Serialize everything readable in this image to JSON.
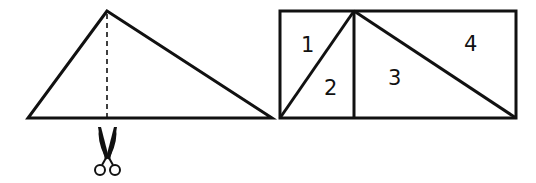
{
  "diagram": {
    "stroke_color": "#111111",
    "triangle": {
      "apex": [
        107,
        11
      ],
      "base_left": [
        28,
        118
      ],
      "base_right": [
        272,
        118
      ],
      "cut_line": "dashed altitude from apex to base",
      "cut_icon": "scissors-icon"
    },
    "rectangle": {
      "x": 280,
      "y": 11,
      "width": 236,
      "height": 107,
      "divider_x": 354,
      "pieces": [
        {
          "id": "piece-1",
          "label": "1"
        },
        {
          "id": "piece-2",
          "label": "2"
        },
        {
          "id": "piece-3",
          "label": "3"
        },
        {
          "id": "piece-4",
          "label": "4"
        }
      ]
    }
  }
}
